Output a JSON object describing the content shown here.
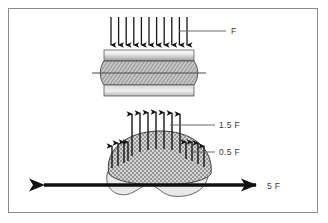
{
  "figure": {
    "frame": {
      "color": "#8c8c8c",
      "background": "#ffffff"
    },
    "palette": {
      "arrow_color": "#161616",
      "leader_color": "#6b6b6b",
      "label_color": "#3a3a3a",
      "plate_light": "#f2f2f2",
      "plate_dark": "#8f8f8f",
      "hatch_fill": "#c9c9c9",
      "hatch_line": "#6e6e6e",
      "stipple_fill": "#d2d2d2",
      "stipple_dot": "#3d3d3d",
      "base_fill": "#e6e6e6",
      "outline": "#4a4a4a"
    },
    "upper": {
      "name": "compression-block",
      "load_label": "F",
      "arrow_count": 11,
      "arrow_direction": "down",
      "description": "Uniform downward load F applied across the top platen of a barrelled hatched block between two plates",
      "centerline": true
    },
    "lower": {
      "name": "stressed-body",
      "center_label": "1.5 F",
      "edge_label": "0.5 F",
      "axial_label": "5 F",
      "center_arrow_count": 7,
      "edge_arrow_count_left": 4,
      "edge_arrow_count_right": 4,
      "arrow_direction": "up",
      "axial_arrow_direction": "double",
      "description": "Non-uniform upward reaction, 1.5 F at the centre and 0.5 F near the edges, with a 5 F double-headed axial force"
    },
    "labels": [
      {
        "id": "label-F",
        "text": "F",
        "x": 231,
        "y": 33
      },
      {
        "id": "label-1-5-F",
        "text": "1.5 F",
        "x": 219,
        "y": 128
      },
      {
        "id": "label-0-5-F",
        "text": "0.5 F",
        "x": 219,
        "y": 155
      },
      {
        "id": "label-5-F",
        "text": "5 F",
        "x": 267,
        "y": 189
      }
    ]
  }
}
